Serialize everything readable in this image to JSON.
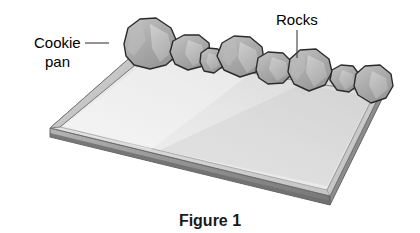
{
  "figure": {
    "caption": "Figure 1",
    "background_color": "#ffffff",
    "labels": [
      {
        "id": "cookie-pan",
        "line1": "Cookie",
        "line2": "pan",
        "text_x": 34,
        "text_y": 45,
        "leader_from_x": 85,
        "leader_from_y": 43,
        "leader_to_x": 109,
        "leader_to_y": 43
      },
      {
        "id": "rocks",
        "line1": "Rocks",
        "text_x": 276,
        "text_y": 25,
        "leader_from_x": 297,
        "leader_from_y": 30,
        "leader_to_x": 297,
        "leader_to_y": 58
      }
    ],
    "colors": {
      "pan_top_light": "#e9e9e9",
      "pan_top_mid": "#d2d2d2",
      "pan_top_dark": "#bdbdbd",
      "pan_rim_light": "#dcdcdc",
      "pan_rim_dark": "#9a9a9a",
      "pan_edge_band": "#8c8c8c",
      "pan_edge_shadow": "#6e6e6e",
      "rock_fill": "#a9a9a9",
      "rock_highlight": "#cfcfcf",
      "rock_shadow": "#8e8e8e",
      "outline": "#2b2b2b",
      "leader_line": "#3c3c3c",
      "label_text": "#000000",
      "caption_text": "#1a1a1a"
    },
    "pan_geometry": {
      "corner_left": [
        50,
        128
      ],
      "corner_top": [
        142,
        47
      ],
      "corner_right": [
        383,
        88
      ],
      "corner_bottom": [
        330,
        196
      ],
      "thickness_px": 9
    },
    "rocks": [
      {
        "id": "rock-1",
        "cx": 150,
        "cy": 44,
        "rx": 27,
        "ry": 24
      },
      {
        "id": "rock-2",
        "cx": 190,
        "cy": 54,
        "rx": 20,
        "ry": 17
      },
      {
        "id": "rock-3",
        "cx": 212,
        "cy": 62,
        "rx": 13,
        "ry": 13
      },
      {
        "id": "rock-4",
        "cx": 240,
        "cy": 57,
        "rx": 24,
        "ry": 21
      },
      {
        "id": "rock-5",
        "cx": 274,
        "cy": 70,
        "rx": 19,
        "ry": 16
      },
      {
        "id": "rock-6",
        "cx": 310,
        "cy": 70,
        "rx": 23,
        "ry": 21
      },
      {
        "id": "rock-7",
        "cx": 344,
        "cy": 80,
        "rx": 16,
        "ry": 14
      },
      {
        "id": "rock-8",
        "cx": 373,
        "cy": 85,
        "rx": 19,
        "ry": 17
      }
    ]
  }
}
